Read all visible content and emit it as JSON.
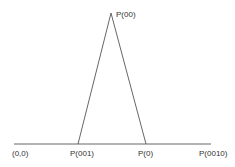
{
  "diagram": {
    "type": "triangle-on-axis",
    "colors": {
      "line": "#555555",
      "text": "#333333",
      "background": "#ffffff"
    },
    "axis": {
      "x1": 14,
      "x2": 211,
      "y": 144
    },
    "apex": {
      "x": 111,
      "y": 13,
      "label": "P(00)"
    },
    "left_foot": {
      "x": 78,
      "y": 144
    },
    "right_foot": {
      "x": 146,
      "y": 144
    },
    "axis_labels": [
      {
        "text": "(0,0)",
        "x": 12
      },
      {
        "text": "P(001)",
        "x": 70
      },
      {
        "text": "P(0)",
        "x": 138
      },
      {
        "text": "P(0010)",
        "x": 199
      }
    ]
  }
}
